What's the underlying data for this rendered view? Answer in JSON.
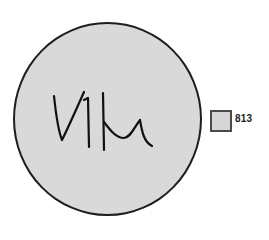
{
  "figure": {
    "signature_text": "ViKu",
    "disc_color": "#d9d9d9",
    "outline_color": "#1e1e1e"
  },
  "swatch": {
    "label": "813",
    "color": "#d6d6d6"
  }
}
